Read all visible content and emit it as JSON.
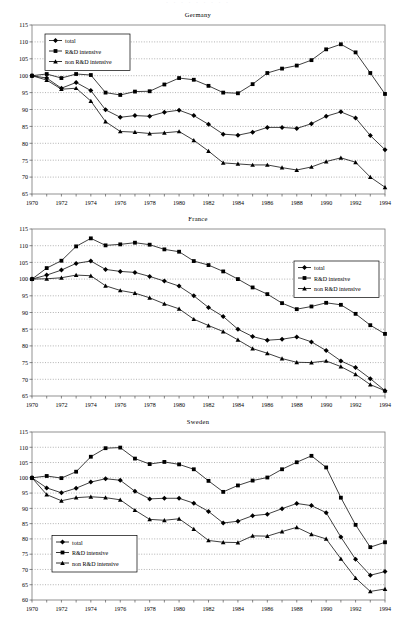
{
  "document": {
    "cut_header_text": "· · · · · · · · ·",
    "background_color": "#ffffff",
    "series_color": "#000000",
    "grid_color": "#808080"
  },
  "legend": {
    "entries": [
      {
        "label": "total",
        "marker": "diamond"
      },
      {
        "label": "R&D intensive",
        "marker": "square"
      },
      {
        "label": "non R&D intensive",
        "marker": "triangle"
      }
    ]
  },
  "chart_data": [
    {
      "type": "line",
      "title": "Germany",
      "xlabel": "",
      "ylabel": "",
      "grid": true,
      "legend_position": "top-left",
      "xlim": [
        1970,
        1994
      ],
      "ylim": [
        65,
        115
      ],
      "yticks": [
        65,
        70,
        75,
        80,
        85,
        90,
        95,
        100,
        105,
        110,
        115
      ],
      "x": [
        1970,
        1971,
        1972,
        1973,
        1974,
        1975,
        1976,
        1977,
        1978,
        1979,
        1980,
        1981,
        1982,
        1983,
        1984,
        1985,
        1986,
        1987,
        1988,
        1989,
        1990,
        1991,
        1992,
        1993,
        1994
      ],
      "xticklabels": [
        "1970",
        "",
        "1972",
        "",
        "1974",
        "",
        "1976",
        "",
        "1978",
        "",
        "1980",
        "",
        "1982",
        "",
        "1984",
        "",
        "1986",
        "",
        "1988",
        "",
        "1990",
        "",
        "1992",
        "",
        "1994"
      ],
      "series": [
        {
          "name": "total",
          "marker": "diamond",
          "values": [
            100.0,
            99.3,
            96.3,
            98.0,
            95.6,
            89.9,
            87.7,
            88.2,
            88.0,
            89.2,
            89.8,
            88.2,
            85.6,
            82.7,
            82.4,
            83.3,
            84.7,
            84.7,
            84.4,
            85.8,
            88.0,
            89.3,
            87.5,
            82.3,
            78.1
          ]
        },
        {
          "name": "R&D intensive",
          "marker": "square",
          "values": [
            100.0,
            100.5,
            99.3,
            100.5,
            100.2,
            95.0,
            94.3,
            95.3,
            95.4,
            97.4,
            99.3,
            98.8,
            97.0,
            95.0,
            94.8,
            97.5,
            100.8,
            102.1,
            103.0,
            104.6,
            107.8,
            109.3,
            106.9,
            100.8,
            94.6
          ]
        },
        {
          "name": "non R&D intensive",
          "marker": "triangle",
          "values": [
            100.0,
            98.7,
            96.0,
            96.3,
            92.5,
            86.4,
            83.5,
            83.3,
            82.9,
            83.1,
            83.5,
            80.9,
            77.7,
            74.2,
            73.9,
            73.6,
            73.6,
            72.8,
            72.1,
            73.0,
            74.6,
            75.7,
            74.4,
            70.0,
            67.0
          ]
        }
      ]
    },
    {
      "type": "line",
      "title": "France",
      "xlabel": "",
      "ylabel": "",
      "grid": true,
      "legend_position": "right",
      "xlim": [
        1970,
        1994
      ],
      "ylim": [
        65,
        115
      ],
      "yticks": [
        65,
        70,
        75,
        80,
        85,
        90,
        95,
        100,
        105,
        110,
        115
      ],
      "x": [
        1970,
        1971,
        1972,
        1973,
        1974,
        1975,
        1976,
        1977,
        1978,
        1979,
        1980,
        1981,
        1982,
        1983,
        1984,
        1985,
        1986,
        1987,
        1988,
        1989,
        1990,
        1991,
        1992,
        1993,
        1994
      ],
      "xticklabels": [
        "1970",
        "",
        "1972",
        "",
        "1974",
        "",
        "1976",
        "",
        "1978",
        "",
        "1980",
        "",
        "1982",
        "",
        "1984",
        "",
        "1986",
        "",
        "1988",
        "",
        "1990",
        "",
        "1992",
        "",
        "1994"
      ],
      "series": [
        {
          "name": "total",
          "marker": "diamond",
          "values": [
            100.0,
            101.2,
            102.7,
            104.7,
            105.4,
            102.9,
            102.3,
            102.0,
            100.8,
            99.4,
            97.9,
            95.0,
            91.5,
            88.8,
            85.0,
            82.8,
            81.7,
            82.0,
            82.7,
            81.2,
            78.6,
            75.5,
            73.5,
            70.2,
            66.6
          ]
        },
        {
          "name": "R&D intensive",
          "marker": "square",
          "values": [
            100.0,
            103.3,
            105.5,
            109.8,
            112.2,
            110.1,
            110.4,
            110.9,
            110.3,
            108.9,
            108.2,
            105.4,
            104.2,
            102.3,
            100.0,
            97.5,
            95.5,
            92.8,
            91.0,
            91.8,
            92.9,
            92.3,
            89.6,
            86.2,
            83.6
          ]
        },
        {
          "name": "non R&D intensive",
          "marker": "triangle",
          "values": [
            100.0,
            100.1,
            100.4,
            101.2,
            101.0,
            98.0,
            96.6,
            95.8,
            94.4,
            92.6,
            91.1,
            88.0,
            86.1,
            84.3,
            81.8,
            79.2,
            77.8,
            76.2,
            75.1,
            75.0,
            75.5,
            73.8,
            71.5,
            68.4,
            66.6
          ]
        }
      ]
    },
    {
      "type": "line",
      "title": "Sweden",
      "xlabel": "",
      "ylabel": "",
      "grid": true,
      "legend_position": "bottom-left",
      "xlim": [
        1970,
        1994
      ],
      "ylim": [
        60,
        115
      ],
      "yticks": [
        60,
        65,
        70,
        75,
        80,
        85,
        90,
        95,
        100,
        105,
        110,
        115
      ],
      "x": [
        1970,
        1971,
        1972,
        1973,
        1974,
        1975,
        1976,
        1977,
        1978,
        1979,
        1980,
        1981,
        1982,
        1983,
        1984,
        1985,
        1986,
        1987,
        1988,
        1989,
        1990,
        1991,
        1992,
        1993,
        1994
      ],
      "xticklabels": [
        "1970",
        "",
        "1972",
        "",
        "1974",
        "",
        "1976",
        "",
        "1978",
        "",
        "1980",
        "",
        "1982",
        "",
        "1984",
        "",
        "1986",
        "",
        "1988",
        "",
        "1990",
        "",
        "1992",
        "",
        "1994"
      ],
      "series": [
        {
          "name": "total",
          "marker": "diamond",
          "values": [
            100.0,
            96.7,
            95.1,
            96.6,
            98.6,
            99.7,
            99.2,
            95.6,
            93.1,
            93.3,
            93.3,
            91.7,
            89.0,
            85.2,
            85.8,
            87.6,
            88.1,
            89.9,
            91.6,
            90.9,
            88.6,
            80.6,
            73.3,
            68.1,
            69.3
          ]
        },
        {
          "name": "R&D intensive",
          "marker": "square",
          "values": [
            100.0,
            100.6,
            99.9,
            102.0,
            106.9,
            109.7,
            109.9,
            106.3,
            104.5,
            105.2,
            104.4,
            102.8,
            99.0,
            95.4,
            97.5,
            99.1,
            100.1,
            102.8,
            105.1,
            107.2,
            103.4,
            93.5,
            84.6,
            77.3,
            78.9
          ]
        },
        {
          "name": "non R&D intensive",
          "marker": "triangle",
          "values": [
            100.0,
            94.5,
            92.5,
            93.5,
            93.8,
            93.5,
            92.8,
            89.4,
            86.4,
            86.1,
            86.6,
            83.2,
            79.5,
            78.9,
            78.8,
            81.0,
            80.9,
            82.4,
            83.8,
            81.5,
            80.0,
            73.5,
            67.2,
            62.8,
            63.6
          ]
        }
      ]
    }
  ]
}
